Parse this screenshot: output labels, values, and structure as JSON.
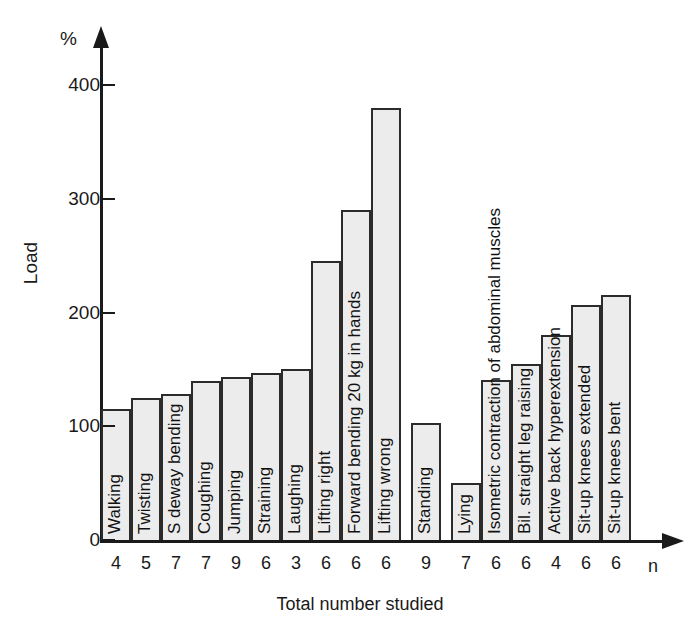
{
  "chart_data": {
    "type": "bar",
    "title": "",
    "ylabel": "Load",
    "yunit": "%",
    "xlabel": "Total number studied",
    "xunit": "n",
    "ylim": [
      0,
      440
    ],
    "yticks": [
      0,
      100,
      200,
      300,
      400
    ],
    "grid": false,
    "legend": "none",
    "categories": [
      "Walking",
      "Twisting",
      "S deway bending",
      "Coughing",
      "Jumping",
      "Straining",
      "Laughing",
      "Lifting right",
      "Forward bending 20 kg in hands",
      "Lifting wrong",
      "Standing",
      "Lying",
      "Isometric contraction of abdominal muscles",
      "Bil. straight leg raising",
      "Active back hyperextension",
      "Sit-up knees extended",
      "Sit-up knees bent"
    ],
    "values": [
      115,
      125,
      128,
      140,
      143,
      147,
      150,
      245,
      290,
      380,
      103,
      50,
      141,
      155,
      180,
      207,
      215
    ],
    "n_values": [
      4,
      5,
      7,
      7,
      9,
      6,
      3,
      6,
      6,
      6,
      9,
      7,
      6,
      6,
      4,
      6,
      6
    ],
    "group_breaks": [
      10,
      11
    ]
  },
  "style": {
    "bar_fill": "#ececec",
    "bar_stroke": "#2b2b2b",
    "axis_color": "#1a1a1a",
    "background": "#ffffff"
  }
}
